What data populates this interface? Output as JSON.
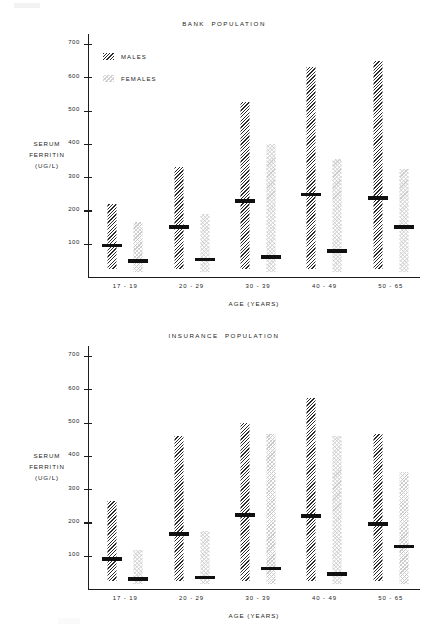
{
  "figure": {
    "axis_titles": {
      "y": "SERUM\nFERRITIN\n(UG/L)",
      "x": "AGE (YEARS)"
    },
    "legend": {
      "males_label": "MALES",
      "females_label": "FEMALES"
    },
    "y_ticks": [
      "100",
      "200",
      "300",
      "400",
      "500",
      "600",
      "700"
    ],
    "categories": [
      "17 - 19",
      "20 - 29",
      "30 - 39",
      "40 - 49",
      "50 - 65"
    ]
  },
  "chart_data": [
    {
      "type": "bar",
      "title": "BANK  POPULATION",
      "xlabel": "AGE (YEARS)",
      "ylabel": "SERUM FERRITIN (UG/L)",
      "ylim": [
        0,
        730
      ],
      "grid": false,
      "legend_position": "upper-left-inside",
      "categories": [
        "17 - 19",
        "20 - 29",
        "30 - 39",
        "40 - 49",
        "50 - 65"
      ],
      "series": [
        {
          "name": "MALES",
          "pattern": "diagonal-hatch-dark",
          "range_low": [
            25,
            25,
            25,
            25,
            25
          ],
          "range_high": [
            220,
            330,
            525,
            630,
            650
          ],
          "median": [
            95,
            150,
            228,
            248,
            237
          ]
        },
        {
          "name": "FEMALES",
          "pattern": "stipple-light",
          "range_low": [
            15,
            15,
            15,
            15,
            15
          ],
          "range_high": [
            165,
            190,
            400,
            355,
            325
          ],
          "median": [
            48,
            52,
            60,
            78,
            150
          ]
        }
      ]
    },
    {
      "type": "bar",
      "title": "INSURANCE  POPULATION",
      "xlabel": "AGE (YEARS)",
      "ylabel": "SERUM FERRITIN (UG/L)",
      "ylim": [
        0,
        730
      ],
      "grid": false,
      "legend_position": "none",
      "categories": [
        "17 - 19",
        "20 - 29",
        "30 - 39",
        "40 - 49",
        "50 - 65"
      ],
      "series": [
        {
          "name": "MALES",
          "pattern": "diagonal-hatch-dark",
          "range_low": [
            25,
            25,
            25,
            25,
            25
          ],
          "range_high": [
            265,
            460,
            500,
            575,
            465
          ],
          "median": [
            90,
            165,
            222,
            220,
            195
          ]
        },
        {
          "name": "FEMALES",
          "pattern": "stipple-light",
          "range_low": [
            15,
            15,
            15,
            15,
            15
          ],
          "range_high": [
            118,
            175,
            465,
            460,
            350
          ],
          "median": [
            30,
            35,
            62,
            45,
            128
          ]
        }
      ]
    }
  ]
}
